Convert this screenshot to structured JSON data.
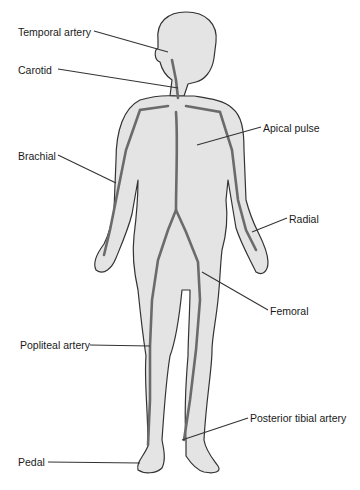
{
  "diagram": {
    "colors": {
      "body_fill": "#e4e4e4",
      "outline": "#333333",
      "artery": "#6b6b6b",
      "leader_line": "#333333",
      "label_text": "#1a1a1a"
    },
    "labels": [
      {
        "id": "temporal",
        "text": "Temporal artery",
        "x": 18,
        "y": 26,
        "target": [
          168,
          52
        ]
      },
      {
        "id": "carotid",
        "text": "Carotid",
        "x": 18,
        "y": 64,
        "target": [
          178,
          88
        ]
      },
      {
        "id": "apical",
        "text": "Apical pulse",
        "x": 263,
        "y": 122,
        "target": [
          197,
          145
        ]
      },
      {
        "id": "brachial",
        "text": "Brachial",
        "x": 18,
        "y": 150,
        "target": [
          116,
          183
        ]
      },
      {
        "id": "radial",
        "text": "Radial",
        "x": 289,
        "y": 213,
        "target": [
          252,
          232
        ]
      },
      {
        "id": "femoral",
        "text": "Femoral",
        "x": 270,
        "y": 305,
        "target": [
          202,
          272
        ]
      },
      {
        "id": "popliteal",
        "text": "Popliteal artery",
        "x": 20,
        "y": 339,
        "target": [
          150,
          346
        ]
      },
      {
        "id": "posterior_tibial",
        "text": "Posterior tibial artery",
        "x": 250,
        "y": 412,
        "target": [
          182,
          440
        ]
      },
      {
        "id": "pedal",
        "text": "Pedal",
        "x": 18,
        "y": 456,
        "target": [
          140,
          463
        ]
      }
    ]
  }
}
